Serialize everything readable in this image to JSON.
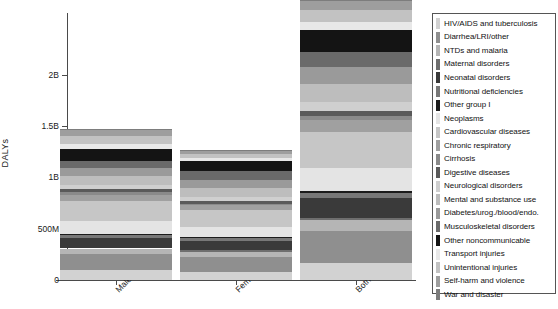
{
  "chart_data": {
    "type": "bar",
    "subtype": "stacked-bar",
    "title": "",
    "xlabel": "",
    "ylabel": "DALYs",
    "categories": [
      "Male",
      "Female",
      "Both"
    ],
    "ylim": [
      0,
      2600000000
    ],
    "yticks": [
      0,
      500000000,
      1000000000,
      1500000000,
      2000000000
    ],
    "ytick_labels": [
      "0",
      "500M",
      "1B",
      "1.5B",
      "2B"
    ],
    "grid": false,
    "legend_position": "right",
    "colormap": "grayscale",
    "series": [
      {
        "name": "HIV/AIDS and tuberculosis",
        "color": "#d2d2d2",
        "values": [
          95000000,
          75000000,
          170000000
        ]
      },
      {
        "name": "Diarrhea/LRI/other",
        "color": "#8f8f8f",
        "values": [
          160000000,
          150000000,
          310000000
        ]
      },
      {
        "name": "NTDs and malaria",
        "color": "#b5b5b5",
        "values": [
          52000000,
          48000000,
          100000000
        ]
      },
      {
        "name": "Maternal disorders",
        "color": "#6e6e6e",
        "values": [
          0,
          20000000,
          20000000
        ]
      },
      {
        "name": "Neonatal disorders",
        "color": "#3a3a3a",
        "values": [
          105000000,
          90000000,
          195000000
        ]
      },
      {
        "name": "Nutritional deficiencies",
        "color": "#787878",
        "values": [
          22000000,
          26000000,
          48000000
        ]
      },
      {
        "name": "Other group I",
        "color": "#1c1c1c",
        "values": [
          13000000,
          13000000,
          26000000
        ]
      },
      {
        "name": "Neoplasms",
        "color": "#e4e4e4",
        "values": [
          128000000,
          92000000,
          220000000
        ]
      },
      {
        "name": "Cardiovascular diseases",
        "color": "#c6c6c6",
        "values": [
          192000000,
          165000000,
          357000000
        ]
      },
      {
        "name": "Chronic respiratory",
        "color": "#a0a0a0",
        "values": [
          59000000,
          50000000,
          109000000
        ]
      },
      {
        "name": "Cirrhosis",
        "color": "#8a8a8a",
        "values": [
          28000000,
          14000000,
          42000000
        ]
      },
      {
        "name": "Digestive diseases",
        "color": "#5a5a5a",
        "values": [
          28000000,
          22000000,
          50000000
        ]
      },
      {
        "name": "Neurological disorders",
        "color": "#cfcfcf",
        "values": [
          43000000,
          48000000,
          91000000
        ]
      },
      {
        "name": "Mental and substance use",
        "color": "#bdbdbd",
        "values": [
          88000000,
          84000000,
          172000000
        ]
      },
      {
        "name": "Diabetes/urog./blood/endo.",
        "color": "#9a9a9a",
        "values": [
          82000000,
          78000000,
          160000000
        ]
      },
      {
        "name": "Musculoskeletal disorders",
        "color": "#6a6a6a",
        "values": [
          67000000,
          83000000,
          150000000
        ]
      },
      {
        "name": "Other noncommunicable",
        "color": "#141414",
        "values": [
          110000000,
          105000000,
          215000000
        ]
      },
      {
        "name": "Transport injuries",
        "color": "#e8e8e8",
        "values": [
          56000000,
          22000000,
          78000000
        ]
      },
      {
        "name": "Unintentional injuries",
        "color": "#c2c2c2",
        "values": [
          72000000,
          46000000,
          118000000
        ]
      },
      {
        "name": "Self-harm and violence",
        "color": "#9e9e9e",
        "values": [
          58000000,
          24000000,
          82000000
        ]
      },
      {
        "name": "War and disaster",
        "color": "#7d7d7d",
        "values": [
          12000000,
          8000000,
          20000000
        ]
      }
    ],
    "totals": [
      1470000000,
      1263000000,
      2733000000
    ]
  },
  "axis": {
    "y_title": "DALYs",
    "y_labels": [
      "2B",
      "1.5B",
      "1B",
      "500M",
      "0"
    ],
    "x_labels": [
      "Male",
      "Female",
      "Both"
    ]
  },
  "legend": {
    "entries": [
      {
        "label": "HIV/AIDS and tuberculosis",
        "color": "#d2d2d2"
      },
      {
        "label": "Diarrhea/LRI/other",
        "color": "#8f8f8f"
      },
      {
        "label": "NTDs and malaria",
        "color": "#b5b5b5"
      },
      {
        "label": "Maternal disorders",
        "color": "#6e6e6e"
      },
      {
        "label": "Neonatal disorders",
        "color": "#3a3a3a"
      },
      {
        "label": "Nutritional deficiencies",
        "color": "#787878"
      },
      {
        "label": "Other group I",
        "color": "#1c1c1c"
      },
      {
        "label": "Neoplasms",
        "color": "#e4e4e4"
      },
      {
        "label": "Cardiovascular diseases",
        "color": "#c6c6c6"
      },
      {
        "label": "Chronic respiratory",
        "color": "#a0a0a0"
      },
      {
        "label": "Cirrhosis",
        "color": "#8a8a8a"
      },
      {
        "label": "Digestive diseases",
        "color": "#5a5a5a"
      },
      {
        "label": "Neurological disorders",
        "color": "#cfcfcf"
      },
      {
        "label": "Mental and substance use",
        "color": "#bdbdbd"
      },
      {
        "label": "Diabetes/urog./blood/endo.",
        "color": "#9a9a9a"
      },
      {
        "label": "Musculoskeletal disorders",
        "color": "#6a6a6a"
      },
      {
        "label": "Other noncommunicable",
        "color": "#141414"
      },
      {
        "label": "Transport injuries",
        "color": "#e8e8e8"
      },
      {
        "label": "Unintentional injuries",
        "color": "#c2c2c2"
      },
      {
        "label": "Self-harm and violence",
        "color": "#9e9e9e"
      },
      {
        "label": "War and disaster",
        "color": "#7d7d7d"
      }
    ]
  }
}
